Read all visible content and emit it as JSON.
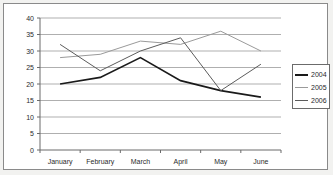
{
  "chart_data": {
    "type": "line",
    "title": "",
    "xlabel": "",
    "ylabel": "",
    "categories": [
      "January",
      "February",
      "March",
      "April",
      "May",
      "June"
    ],
    "series": [
      {
        "name": "2004",
        "values": [
          20,
          22,
          28,
          21,
          18,
          16
        ],
        "color": "#1a1a1a"
      },
      {
        "name": "2005",
        "values": [
          28,
          29,
          33,
          32,
          36,
          30
        ],
        "color": "#9a9a9a"
      },
      {
        "name": "2006",
        "values": [
          32,
          24,
          30,
          34,
          18,
          26
        ],
        "color": "#5c5c5c"
      }
    ],
    "ylim": [
      0,
      40
    ],
    "yticks": [
      0,
      5,
      10,
      15,
      20,
      25,
      30,
      35,
      40
    ],
    "ytick_labels": [
      "0",
      "5",
      "10",
      "15",
      "20",
      "25",
      "30",
      "35",
      "40"
    ],
    "grid": true,
    "legend_position": "right"
  },
  "legend": {
    "entries": [
      {
        "label": "2004"
      },
      {
        "label": "2005"
      },
      {
        "label": "2006"
      }
    ]
  },
  "axes": {
    "y_labels": [
      "40",
      "35",
      "30",
      "25",
      "20",
      "15",
      "10",
      "5",
      "0"
    ],
    "x_labels": [
      "January",
      "February",
      "March",
      "April",
      "May",
      "June"
    ]
  }
}
